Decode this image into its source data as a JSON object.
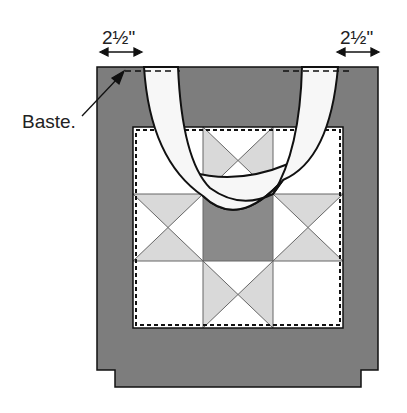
{
  "figure": {
    "labels": {
      "left_measure": "2½\"",
      "right_measure": "2½\"",
      "baste": "Baste."
    },
    "colors": {
      "bag_body": "#7d7d7d",
      "outline": "#111111",
      "quilt_light": "#ffffff",
      "quilt_medium": "#d9d9d9",
      "quilt_center": "#8a8a8a",
      "handle": "#f7f7f7"
    },
    "quilt_block": {
      "rows": 3,
      "cols": 3,
      "layout": [
        [
          "plain",
          "hourglass-top",
          "plain"
        ],
        [
          "hourglass-side",
          "center",
          "hourglass-side"
        ],
        [
          "plain",
          "hourglass-bottom",
          "plain"
        ]
      ]
    }
  }
}
